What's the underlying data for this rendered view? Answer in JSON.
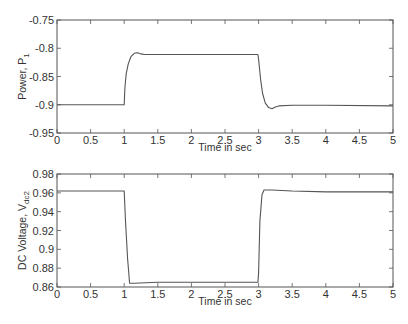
{
  "chart_data": [
    {
      "type": "line",
      "title": "",
      "xlabel": "Time in sec",
      "ylabel": "Power, P1",
      "ylabel_main": "Power, P",
      "ylabel_sub": "1",
      "xlim": [
        0,
        5
      ],
      "ylim": [
        -0.95,
        -0.75
      ],
      "xticks": [
        0,
        0.5,
        1,
        1.5,
        2,
        2.5,
        3,
        3.5,
        4,
        4.5,
        5
      ],
      "xtick_labels": [
        "0",
        "0.5",
        "1",
        "1.5",
        "2",
        "2.5",
        "3",
        "3.5",
        "4",
        "4.5",
        "5"
      ],
      "yticks": [
        -0.75,
        -0.8,
        -0.85,
        -0.9,
        -0.95
      ],
      "ytick_labels": [
        "-0.75",
        "-0.8",
        "-0.85",
        "-0.9",
        "-0.95"
      ],
      "grid": false,
      "series": [
        {
          "name": "P1",
          "x": [
            0,
            1.0,
            1.01,
            1.03,
            1.06,
            1.1,
            1.15,
            1.2,
            1.25,
            1.3,
            1.4,
            2.0,
            2.99,
            3.0,
            3.03,
            3.06,
            3.1,
            3.15,
            3.2,
            3.25,
            3.3,
            3.5,
            4.0,
            5.0
          ],
          "y": [
            -0.9,
            -0.9,
            -0.87,
            -0.845,
            -0.828,
            -0.815,
            -0.809,
            -0.808,
            -0.81,
            -0.811,
            -0.811,
            -0.811,
            -0.811,
            -0.82,
            -0.855,
            -0.88,
            -0.897,
            -0.905,
            -0.907,
            -0.904,
            -0.902,
            -0.901,
            -0.901,
            -0.902
          ]
        }
      ]
    },
    {
      "type": "line",
      "title": "",
      "xlabel": "Time in sec",
      "ylabel": "DC Voltage, Vdc2",
      "ylabel_main": "DC Voltage, V",
      "ylabel_sub": "dc2",
      "xlim": [
        0,
        5
      ],
      "ylim": [
        0.86,
        0.98
      ],
      "xticks": [
        0,
        0.5,
        1,
        1.5,
        2,
        2.5,
        3,
        3.5,
        4,
        4.5,
        5
      ],
      "xtick_labels": [
        "0",
        "0.5",
        "1",
        "1.5",
        "2",
        "2.5",
        "3",
        "3.5",
        "4",
        "4.5",
        "5"
      ],
      "yticks": [
        0.98,
        0.96,
        0.94,
        0.92,
        0.9,
        0.88,
        0.86
      ],
      "ytick_labels": [
        "0.98",
        "0.96",
        "0.94",
        "0.92",
        "0.9",
        "0.88",
        "0.86"
      ],
      "grid": false,
      "series": [
        {
          "name": "Vdc2",
          "x": [
            0,
            1.0,
            1.02,
            1.05,
            1.08,
            1.15,
            1.5,
            2.0,
            2.5,
            2.99,
            3.0,
            3.02,
            3.05,
            3.08,
            3.2,
            3.5,
            4.0,
            4.5,
            5.0
          ],
          "y": [
            0.962,
            0.962,
            0.93,
            0.89,
            0.864,
            0.864,
            0.865,
            0.865,
            0.865,
            0.865,
            0.875,
            0.93,
            0.958,
            0.963,
            0.963,
            0.962,
            0.961,
            0.961,
            0.961
          ]
        }
      ]
    }
  ]
}
